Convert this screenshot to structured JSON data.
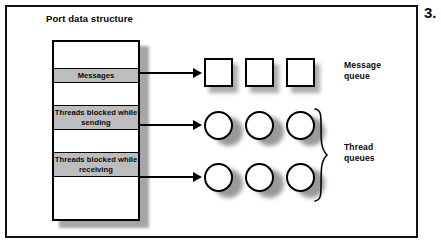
{
  "figure": {
    "number": "3.",
    "title": "Port data structure"
  },
  "port_column": {
    "bands": [
      {
        "label": "",
        "filled": false
      },
      {
        "label": "Messages",
        "filled": true
      },
      {
        "label": "",
        "filled": false
      },
      {
        "label": "Threads blocked while sending",
        "filled": true
      },
      {
        "label": "",
        "filled": false
      },
      {
        "label": "Threads blocked while receiving",
        "filled": true
      },
      {
        "label": "",
        "filled": false
      }
    ]
  },
  "queues": [
    {
      "name": "message-queue",
      "label_line1": "Message",
      "label_line2": "queue",
      "shape": "square",
      "count": 3,
      "source_band": "Messages"
    },
    {
      "name": "send-thread-queue",
      "shape": "circle",
      "count": 3,
      "source_band": "Threads blocked while sending"
    },
    {
      "name": "receive-thread-queue",
      "shape": "circle",
      "count": 3,
      "source_band": "Threads blocked while receiving"
    }
  ],
  "thread_queues_label": {
    "line1": "Thread",
    "line2": "queues"
  },
  "colors": {
    "band_fill": "#bdbdbd",
    "stroke": "#000000",
    "shadow": "#9a9a9a",
    "background": "#ffffff"
  }
}
